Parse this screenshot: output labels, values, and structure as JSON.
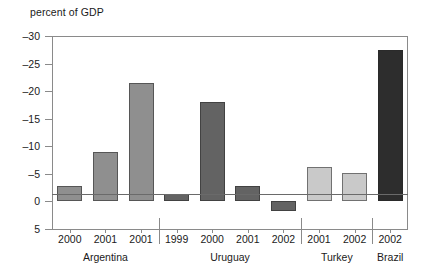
{
  "chart_data": {
    "type": "bar",
    "title": "",
    "ylabel": "percent of GDP",
    "xlabel": "",
    "ylim": [
      5,
      -30
    ],
    "y_ticks": [
      -30,
      -25,
      -20,
      -15,
      -10,
      -5,
      0,
      5
    ],
    "y_tick_labels": [
      "–30",
      "–25",
      "–20",
      "–15",
      "–10",
      "–5",
      "0",
      "5"
    ],
    "grid": false,
    "legend": "none",
    "note": "Y axis is inverted: more negative (larger deficit) plots upward.",
    "categories": [
      "2000",
      "2001",
      "2001",
      "1999",
      "2000",
      "2001",
      "2002",
      "2001",
      "2002",
      "2002"
    ],
    "values": [
      -2.8,
      -9.0,
      -21.5,
      -1.3,
      -18.0,
      -2.8,
      1.8,
      -6.2,
      -5.2,
      -27.5
    ],
    "groups": [
      {
        "label": "Argentina",
        "color": "#8f8f8f",
        "indices": [
          0,
          1,
          2
        ]
      },
      {
        "label": "Uruguay",
        "color": "#636363",
        "indices": [
          3,
          4,
          5,
          6
        ]
      },
      {
        "label": "Turkey",
        "color": "#c9c9c9",
        "indices": [
          7,
          8
        ]
      },
      {
        "label": "Brazil",
        "color": "#2d2d2d",
        "indices": [
          9
        ]
      }
    ],
    "bars": [
      {
        "category": "2000",
        "group": "Argentina",
        "value": -2.8,
        "color": "#8f8f8f"
      },
      {
        "category": "2001",
        "group": "Argentina",
        "value": -9.0,
        "color": "#8f8f8f"
      },
      {
        "category": "2001",
        "group": "Argentina",
        "value": -21.5,
        "color": "#8f8f8f"
      },
      {
        "category": "1999",
        "group": "Uruguay",
        "value": -1.3,
        "color": "#636363"
      },
      {
        "category": "2000",
        "group": "Uruguay",
        "value": -18.0,
        "color": "#636363"
      },
      {
        "category": "2001",
        "group": "Uruguay",
        "value": -2.8,
        "color": "#636363"
      },
      {
        "category": "2002",
        "group": "Uruguay",
        "value": 1.8,
        "color": "#636363"
      },
      {
        "category": "2001",
        "group": "Turkey",
        "value": -6.2,
        "color": "#c9c9c9"
      },
      {
        "category": "2002",
        "group": "Turkey",
        "value": -5.2,
        "color": "#c9c9c9"
      },
      {
        "category": "2002",
        "group": "Brazil",
        "value": -27.5,
        "color": "#2d2d2d"
      }
    ]
  }
}
